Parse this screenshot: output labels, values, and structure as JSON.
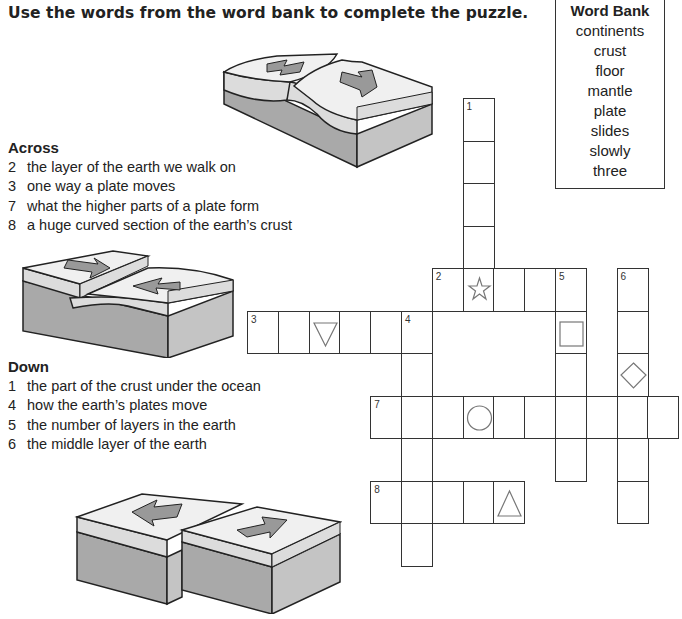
{
  "instructions": "Use the words from the word bank to complete the puzzle.",
  "word_bank": {
    "title": "Word Bank",
    "words": [
      "continents",
      "crust",
      "floor",
      "mantle",
      "plate",
      "slides",
      "slowly",
      "three"
    ]
  },
  "across": {
    "heading": "Across",
    "clues": [
      {
        "num": "2",
        "text": "the layer of the earth we walk on"
      },
      {
        "num": "3",
        "text": "one way a plate moves"
      },
      {
        "num": "7",
        "text": "what the higher parts of a plate form"
      },
      {
        "num": "8",
        "text": "a huge curved section of the earth’s crust"
      }
    ]
  },
  "down": {
    "heading": "Down",
    "clues": [
      {
        "num": "1",
        "text": "the part of the crust under the ocean"
      },
      {
        "num": "4",
        "text": "how the earth’s plates move"
      },
      {
        "num": "5",
        "text": "the number of layers in the earth"
      },
      {
        "num": "6",
        "text": "the middle layer of the earth"
      }
    ]
  },
  "grid": {
    "origin_x": 247,
    "origin_y": 98,
    "cell_w": 30.8,
    "cell_h": 42.5,
    "words": [
      {
        "num": "1",
        "dir": "down",
        "col": 7,
        "row": 0,
        "len": 5
      },
      {
        "num": "2",
        "dir": "across",
        "col": 6,
        "row": 4,
        "len": 5
      },
      {
        "num": "3",
        "dir": "across",
        "col": 0,
        "row": 5,
        "len": 6
      },
      {
        "num": "4",
        "dir": "down",
        "col": 5,
        "row": 5,
        "len": 6
      },
      {
        "num": "5",
        "dir": "down",
        "col": 10,
        "row": 4,
        "len": 5
      },
      {
        "num": "6",
        "dir": "down",
        "col": 12,
        "row": 4,
        "len": 6
      },
      {
        "num": "7",
        "dir": "across",
        "col": 4,
        "row": 7,
        "len": 10
      },
      {
        "num": "8",
        "dir": "across",
        "col": 4,
        "row": 9,
        "len": 5
      }
    ],
    "shapes": [
      {
        "shape": "star",
        "col": 7,
        "row": 4
      },
      {
        "shape": "triangle-down",
        "col": 2,
        "row": 5
      },
      {
        "shape": "square",
        "col": 10,
        "row": 5
      },
      {
        "shape": "diamond",
        "col": 12,
        "row": 6
      },
      {
        "shape": "circle",
        "col": 7,
        "row": 7
      },
      {
        "shape": "triangle-up",
        "col": 8,
        "row": 9
      }
    ]
  },
  "illustrations": [
    {
      "name": "plates-diverging-illustration"
    },
    {
      "name": "plates-subducting-illustration"
    },
    {
      "name": "plates-sliding-illustration"
    }
  ]
}
